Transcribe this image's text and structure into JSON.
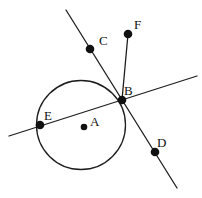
{
  "figure": {
    "width": 202,
    "height": 198,
    "background": "#ffffff",
    "stroke_color": "#1e1e1e",
    "dot_color": "#111111",
    "label_color": "#111111",
    "line_width": 1.3,
    "circle": {
      "name": "circle-outline",
      "cx": 81,
      "cy": 125,
      "r": 44.5
    },
    "lines": [
      {
        "name": "secant-line-cbd",
        "x1": 66,
        "y1": 10,
        "x2": 177,
        "y2": 188
      },
      {
        "name": "secant-line-eb",
        "x1": 9,
        "y1": 136,
        "x2": 197,
        "y2": 76
      },
      {
        "name": "segment-bf",
        "x1": 122,
        "y1": 100,
        "x2": 128,
        "y2": 34
      }
    ],
    "points": [
      {
        "label": "A",
        "x": 84,
        "y": 127,
        "r": 3.3,
        "label_x": 90,
        "label_y": 126
      },
      {
        "label": "B",
        "x": 122,
        "y": 100,
        "r": 4.3,
        "label_x": 124,
        "label_y": 95
      },
      {
        "label": "C",
        "x": 90,
        "y": 49,
        "r": 4.3,
        "label_x": 99,
        "label_y": 45
      },
      {
        "label": "D",
        "x": 155,
        "y": 152,
        "r": 4.3,
        "label_x": 157,
        "label_y": 147
      },
      {
        "label": "E",
        "x": 40,
        "y": 125,
        "r": 4.3,
        "label_x": 44,
        "label_y": 120
      },
      {
        "label": "F",
        "x": 128,
        "y": 34,
        "r": 4.3,
        "label_x": 134,
        "label_y": 29
      }
    ]
  }
}
